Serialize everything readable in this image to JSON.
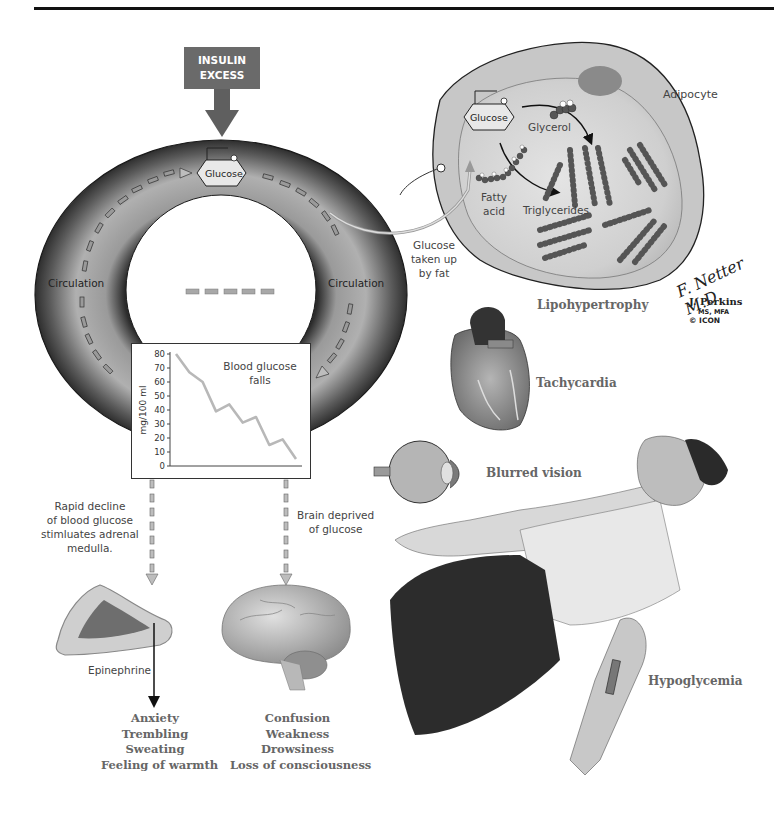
{
  "header": {
    "insulin_line1": "INSULIN",
    "insulin_line2": "EXCESS"
  },
  "torus": {
    "glucose_label": "Glucose",
    "circulation_left": "Circulation",
    "circulation_right": "Circulation"
  },
  "adipocyte": {
    "cell_label": "Adipocyte",
    "glucose_label": "Glucose",
    "glycerol_label": "Glycerol",
    "fatty_acid_line1": "Fatty",
    "fatty_acid_line2": "acid",
    "triglycerides_label": "Triglycerides",
    "uptake_line1": "Glucose",
    "uptake_line2": "taken up",
    "uptake_line3": "by fat",
    "condition_label": "Lipohypertrophy"
  },
  "credits": {
    "signature": "F. Netter M.D.",
    "artist": "J. Perkins",
    "artist_degree": "MS, MFA",
    "copyright": "© ICON"
  },
  "chart_data": {
    "type": "line",
    "xlabel": "",
    "ylabel": "mg/100 ml",
    "ylim": [
      0,
      80
    ],
    "yticks": [
      "0",
      "10",
      "20",
      "30",
      "40",
      "50",
      "60",
      "70",
      "80"
    ],
    "x": [
      0,
      1,
      2,
      3,
      4,
      5,
      6,
      7,
      8,
      9
    ],
    "values": [
      80,
      67,
      60,
      39,
      44,
      31,
      35,
      15,
      19,
      5
    ],
    "grid": false,
    "line_color": "#b8b8b8"
  },
  "adrenal": {
    "text_line1": "Rapid decline",
    "text_line2": "of blood glucose",
    "text_line3": "stimluates adrenal",
    "text_line4": "medulla.",
    "hormone_label": "Epinephrine",
    "symptoms": [
      "Anxiety",
      "Trembling",
      "Sweating",
      "Feeling of warmth"
    ]
  },
  "brain": {
    "text_line1": "Brain deprived",
    "text_line2": "of glucose",
    "symptoms": [
      "Confusion",
      "Weakness",
      "Drowsiness",
      "Loss of consciousness"
    ]
  },
  "effects": {
    "heart_label": "Tachycardia",
    "eye_label": "Blurred vision",
    "patient_label": "Hypoglycemia"
  }
}
